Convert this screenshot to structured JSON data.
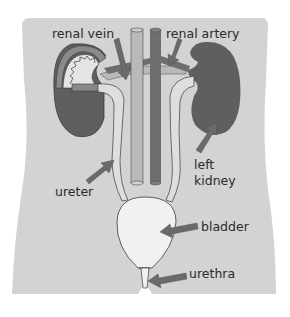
{
  "diagram": {
    "labels": {
      "renal_vein": "renal vein",
      "renal_artery": "renal artery",
      "left_kidney_line1": "left",
      "left_kidney_line2": "kidney",
      "ureter": "ureter",
      "bladder": "bladder",
      "urethra": "urethra"
    },
    "structures": [
      "body-silhouette",
      "right-kidney-cutaway",
      "left-kidney",
      "renal-vein",
      "renal-artery",
      "inferior-vena-cava",
      "aorta",
      "left-ureter",
      "right-ureter",
      "bladder",
      "urethra"
    ],
    "colors": {
      "background": "#ffffff",
      "body": "#d3d3d3",
      "kidney": "#5f5f5f",
      "artery": "#6e6e6e",
      "vein": "#b9b9b9",
      "ureter": "#dedede",
      "bladder": "#f1f1f1",
      "arrow": "#6a6a6a",
      "outline": "#3a3a3a",
      "text": "#2a2a2a"
    }
  }
}
